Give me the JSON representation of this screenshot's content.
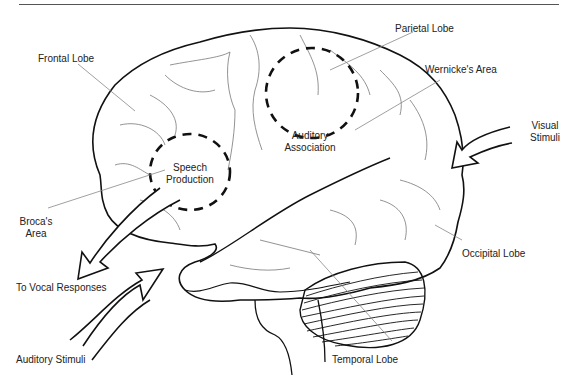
{
  "diagram": {
    "labels": {
      "frontal_lobe": "Frontal Lobe",
      "parietal_lobe": "Parietal Lobe",
      "wernickes_area": "Wernicke's Area",
      "auditory_association_line1": "Auditory",
      "auditory_association_line2": "Association",
      "visual_stimuli_line1": "Visual",
      "visual_stimuli_line2": "Stimuli",
      "speech_production_line1": "Speech",
      "speech_production_line2": "Production",
      "brocas_area_line1": "Broca's",
      "brocas_area_line2": "Area",
      "occipital_lobe": "Occipital Lobe",
      "to_vocal_responses": "To Vocal Responses",
      "auditory_stimuli": "Auditory Stimuli",
      "temporal_lobe": "Temporal Lobe"
    },
    "colors": {
      "outline": "#111111",
      "sulci": "#777777",
      "leader_lines": "#888888",
      "text": "#222222"
    }
  }
}
